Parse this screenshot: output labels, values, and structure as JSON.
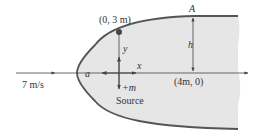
{
  "diagram": {
    "labels": {
      "stagnation_point": "a",
      "point_top": "(0, 3 m)",
      "point_A": "A",
      "height": "h",
      "x_axis": "x",
      "y_axis": "y",
      "source_strength": "+m",
      "source": "Source",
      "downstream_point": "(4m, 0)",
      "freestream_velocity": "7 m/s"
    },
    "colors": {
      "body_fill": "#e6e6e6",
      "body_outline": "#555555",
      "line": "#444444",
      "text": "#333333",
      "point": "#444444"
    }
  }
}
